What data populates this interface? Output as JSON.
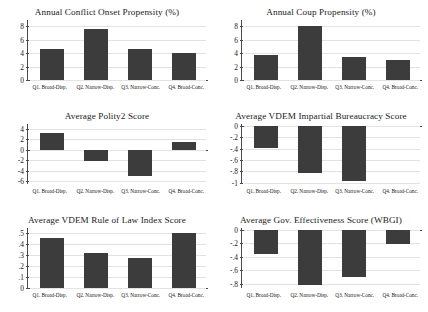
{
  "figure": {
    "categories": [
      "Q1. Broad-Disp.",
      "Q2. Narrow-Disp.",
      "Q3. Narrow-Conc.",
      "Q4. Broad-Conc."
    ],
    "bar_color": "#3c3c3c",
    "grid_color": "#e2e2e2",
    "axis_color": "#4a4a4a",
    "background": "#ffffff"
  },
  "chart_data": [
    {
      "type": "bar",
      "panel": "top-left",
      "title": "Annual Conflict Onset Propensity (%)",
      "categories": [
        "Q1. Broad-Disp.",
        "Q2. Narrow-Disp.",
        "Q3. Narrow-Conc.",
        "Q4. Broad-Conc."
      ],
      "values": [
        4.6,
        7.5,
        4.58,
        3.95
      ],
      "ticks": [
        "0",
        "2",
        "4",
        "6",
        "8"
      ],
      "tick_values": [
        0,
        2,
        4,
        6,
        8
      ],
      "ylim": [
        0,
        8.6
      ],
      "xlabel": "",
      "ylabel": "",
      "grid": true,
      "legend": "none"
    },
    {
      "type": "bar",
      "panel": "top-right",
      "title": "Annual Coup Propensity (%)",
      "categories": [
        "Q1. Broad-Disp.",
        "Q2. Narrow-Disp.",
        "Q3. Narrow-Conc.",
        "Q4. Broad-Conc."
      ],
      "values": [
        3.7,
        8.0,
        3.45,
        2.9
      ],
      "ticks": [
        "0",
        "2",
        "4",
        "6",
        "8"
      ],
      "tick_values": [
        0,
        2,
        4,
        6,
        8
      ],
      "ylim": [
        0,
        8.6
      ],
      "xlabel": "",
      "ylabel": "",
      "grid": true,
      "legend": "none"
    },
    {
      "type": "bar",
      "panel": "middle-left",
      "title": "Average Polity2 Score",
      "categories": [
        "Q1. Broad-Disp.",
        "Q2. Narrow-Disp.",
        "Q3. Narrow-Conc.",
        "Q4. Broad-Conc."
      ],
      "values": [
        3.2,
        -2.1,
        -5.0,
        1.5
      ],
      "ticks": [
        "4",
        "2",
        "0",
        "-2",
        "-4",
        "-6"
      ],
      "tick_values": [
        4,
        2,
        0,
        -2,
        -4,
        -6
      ],
      "ylim": [
        -6.6,
        4.6
      ],
      "xlabel": "",
      "ylabel": "",
      "grid": true,
      "legend": "none"
    },
    {
      "type": "bar",
      "panel": "middle-right",
      "title": "Average VDEM Impartial Bureaucracy Score",
      "categories": [
        "Q1. Broad-Disp.",
        "Q2. Narrow-Disp.",
        "Q3. Narrow-Conc.",
        "Q4. Broad-Conc."
      ],
      "values": [
        -0.39,
        -0.82,
        -0.96,
        0
      ],
      "ticks": [
        "0",
        "-.2",
        "-.4",
        "-.6",
        "-.8",
        "-1"
      ],
      "tick_values": [
        0,
        -0.2,
        -0.4,
        -0.6,
        -0.8,
        -1
      ],
      "ylim": [
        -1.02,
        0
      ],
      "xlabel": "",
      "ylabel": "",
      "grid": true,
      "legend": "none"
    },
    {
      "type": "bar",
      "panel": "bottom-left",
      "title": "Average VDEM Rule of Law Index Score",
      "categories": [
        "Q1. Broad-Disp.",
        "Q2. Narrow-Disp.",
        "Q3. Narrow-Conc.",
        "Q4. Broad-Conc."
      ],
      "values": [
        0.455,
        0.32,
        0.277,
        0.503
      ],
      "ticks": [
        ".5",
        ".4",
        ".3",
        ".2",
        ".1",
        "0"
      ],
      "tick_values": [
        0.5,
        0.4,
        0.3,
        0.2,
        0.1,
        0
      ],
      "ylim": [
        0,
        0.53
      ],
      "xlabel": "",
      "ylabel": "",
      "grid": true,
      "legend": "none"
    },
    {
      "type": "bar",
      "panel": "bottom-right",
      "title": "Average Gov. Effectiveness Score (WBGI)",
      "categories": [
        "Q1. Broad-Disp.",
        "Q2. Narrow-Disp.",
        "Q3. Narrow-Conc.",
        "Q4. Broad-Conc."
      ],
      "values": [
        -0.35,
        -0.82,
        -0.7,
        -0.21
      ],
      "ticks": [
        "0",
        "-.2",
        "-.4",
        "-.6",
        "-.8"
      ],
      "tick_values": [
        0,
        -0.2,
        -0.4,
        -0.6,
        -0.8
      ],
      "ylim": [
        -0.86,
        0
      ],
      "xlabel": "",
      "ylabel": "",
      "grid": true,
      "legend": "none"
    }
  ]
}
